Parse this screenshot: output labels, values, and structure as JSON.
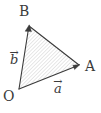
{
  "figure": {
    "type": "vector-triangle-diagram",
    "width": 101,
    "height": 113,
    "background_color": "#ffffff",
    "stroke_color": "#3b3b3b",
    "hatch_color": "#b9b9b9",
    "labels": {
      "point_o": "O",
      "point_a": "A",
      "point_b": "B",
      "vector_a_symbol": "a",
      "vector_b_symbol": "b",
      "vector_arrow_glyph": "→"
    },
    "points": {
      "O": {
        "x": 19,
        "y": 89
      },
      "A": {
        "x": 79,
        "y": 65
      },
      "B": {
        "x": 29,
        "y": 26
      }
    },
    "vectors": [
      {
        "name": "a",
        "from": "O",
        "to": "A",
        "arrowhead": true
      },
      {
        "name": "b",
        "from": "O",
        "to": "B",
        "arrowhead": true
      }
    ],
    "edges": [
      {
        "from": "B",
        "to": "A",
        "arrowhead": false
      }
    ],
    "fill": {
      "pattern": "diagonal-hatch",
      "angle_deg": 45,
      "spacing_px": 2,
      "line_width_px": 0.6
    }
  }
}
